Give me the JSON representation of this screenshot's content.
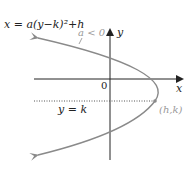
{
  "diagram": {
    "equation": "x = a(y−k)²+h",
    "condition": "a < 0",
    "y_axis_label": "y",
    "x_axis_label": "x",
    "origin_label": "0",
    "line_label": "y = k",
    "vertex_label": "(h,k)",
    "colors": {
      "axis": "#222222",
      "curve": "#8a8a8a",
      "dotted_line": "#555555",
      "vertex_label": "#999999"
    }
  }
}
